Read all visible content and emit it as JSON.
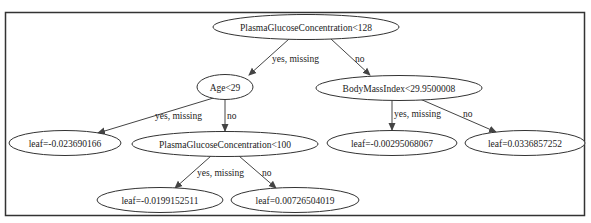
{
  "tree": {
    "nodes": {
      "root": {
        "label": "PlasmaGlucoseConcentration<128"
      },
      "age": {
        "label": "Age<29"
      },
      "bmi": {
        "label": "BodyMassIndex<29.9500008"
      },
      "leaf1": {
        "label": "leaf=-0.023690166"
      },
      "pgc100": {
        "label": "PlasmaGlucoseConcentration<100"
      },
      "leaf2": {
        "label": "leaf=-0.00295068067"
      },
      "leaf3": {
        "label": "leaf=0.0336857252"
      },
      "leaf4": {
        "label": "leaf=-0.0199152511"
      },
      "leaf5": {
        "label": "leaf=0.00726504019"
      }
    },
    "edges": {
      "root_age": {
        "label": "yes, missing"
      },
      "root_bmi": {
        "label": "no"
      },
      "age_leaf1": {
        "label": "yes, missing"
      },
      "age_pgc100": {
        "label": "no"
      },
      "bmi_leaf2": {
        "label": "yes, missing"
      },
      "bmi_leaf3": {
        "label": "no"
      },
      "pgc100_leaf4": {
        "label": "yes, missing"
      },
      "pgc100_leaf5": {
        "label": "no"
      }
    }
  },
  "colors": {
    "border": "#333333",
    "edge": "#444444",
    "background": "#ffffff"
  }
}
